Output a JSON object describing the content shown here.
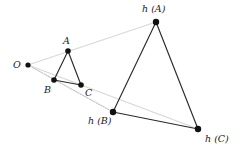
{
  "figure": {
    "width": 243,
    "height": 155,
    "background": "#ffffff",
    "colors": {
      "point": "#111111",
      "solid_edge": "#2b2b2b",
      "ray": "#d8d8d8",
      "ray_dotted": "#bdbdbd",
      "label": "#1a1a1a"
    },
    "points": [
      {
        "id": "O",
        "label": "O",
        "x": 28,
        "y": 65,
        "r": 2.6,
        "label_x": 13,
        "label_y": 60
      },
      {
        "id": "A",
        "label": "A",
        "x": 68,
        "y": 51,
        "r": 2.8,
        "label_x": 63,
        "label_y": 36
      },
      {
        "id": "B",
        "label": "B",
        "x": 54,
        "y": 80,
        "r": 2.8,
        "label_x": 44,
        "label_y": 85
      },
      {
        "id": "C",
        "label": "C",
        "x": 81,
        "y": 85,
        "r": 2.8,
        "label_x": 85,
        "label_y": 88
      },
      {
        "id": "hA",
        "label": "h (A)",
        "x": 156,
        "y": 22,
        "r": 3.2,
        "label_x": 142,
        "label_y": 4
      },
      {
        "id": "hB",
        "label": "h (B)",
        "x": 113,
        "y": 112,
        "r": 3.2,
        "label_x": 88,
        "label_y": 116
      },
      {
        "id": "hC",
        "label": "h (C)",
        "x": 198,
        "y": 129,
        "r": 3.2,
        "label_x": 205,
        "label_y": 134
      }
    ],
    "solid_edges": [
      {
        "name": "edge-A-B",
        "from": "A",
        "to": "B"
      },
      {
        "name": "edge-A-C",
        "from": "A",
        "to": "C"
      },
      {
        "name": "edge-B-C",
        "from": "B",
        "to": "C"
      },
      {
        "name": "edge-hA-hB",
        "from": "hA",
        "to": "hB"
      },
      {
        "name": "edge-hA-hC",
        "from": "hA",
        "to": "hC"
      },
      {
        "name": "edge-hB-hC",
        "from": "hB",
        "to": "hC"
      }
    ],
    "rays": [
      {
        "name": "ray-O-hA",
        "from": "O",
        "to": "hA",
        "style": "solid-light"
      },
      {
        "name": "ray-O-hB",
        "from": "O",
        "to": "hB",
        "style": "dotted-light"
      },
      {
        "name": "ray-O-hC",
        "from": "O",
        "to": "hC",
        "style": "solid-light"
      }
    ]
  }
}
